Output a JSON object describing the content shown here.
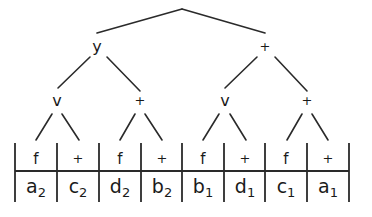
{
  "diagram": {
    "type": "tree-over-table",
    "root": {
      "label": "",
      "x": 182,
      "y": 9
    },
    "level1": [
      {
        "label": "y",
        "x": 97,
        "y": 52
      },
      {
        "label": "+",
        "x": 265,
        "y": 50
      }
    ],
    "level2": [
      {
        "label": "v",
        "x": 57,
        "y": 104,
        "parent": 0
      },
      {
        "label": "+",
        "x": 140,
        "y": 103,
        "parent": 0
      },
      {
        "label": "v",
        "x": 225,
        "y": 104,
        "parent": 1
      },
      {
        "label": "+",
        "x": 307,
        "y": 103,
        "parent": 1
      }
    ],
    "cells": [
      {
        "top": "f",
        "bottom_base": "a",
        "bottom_sub": "2"
      },
      {
        "top": "+",
        "bottom_base": "c",
        "bottom_sub": "2"
      },
      {
        "top": "f",
        "bottom_base": "d",
        "bottom_sub": "2"
      },
      {
        "top": "+",
        "bottom_base": "b",
        "bottom_sub": "2"
      },
      {
        "top": "f",
        "bottom_base": "b",
        "bottom_sub": "1"
      },
      {
        "top": "+",
        "bottom_base": "d",
        "bottom_sub": "1"
      },
      {
        "top": "f",
        "bottom_base": "c",
        "bottom_sub": "1"
      },
      {
        "top": "+",
        "bottom_base": "a",
        "bottom_sub": "1"
      }
    ],
    "colors": {
      "line": "#2a2a2a",
      "text": "#1a1a1a",
      "background": "#ffffff"
    }
  }
}
